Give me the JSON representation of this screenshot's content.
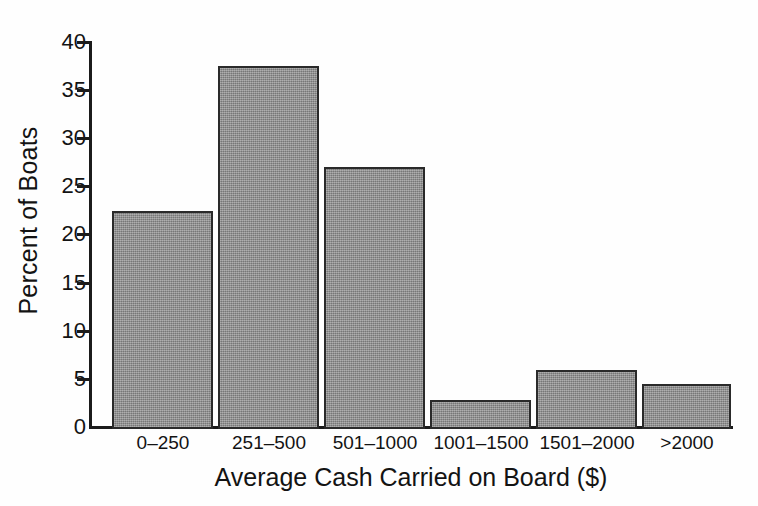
{
  "chart_data": {
    "type": "bar",
    "title": "",
    "subtitle": "",
    "xlabel": "Average Cash Carried on Board ($)",
    "ylabel": "Percent of Boats",
    "categories": [
      "0–250",
      "251–500",
      "501–1000",
      "1001–1500",
      "1501–2000",
      ">2000"
    ],
    "values": [
      22.5,
      37.4,
      27.0,
      3.0,
      6.1,
      4.6
    ],
    "ylim": [
      0,
      40
    ],
    "ytick_values": [
      0,
      5,
      10,
      15,
      20,
      25,
      30,
      35,
      40
    ],
    "ytick_labels": [
      "0",
      "5",
      "10",
      "15",
      "20",
      "25",
      "30",
      "35",
      "40"
    ],
    "xtick_labels": [
      "0–250",
      "251–500",
      "501–1000",
      "1001–1500",
      "1501–2000",
      ">2000"
    ],
    "grid": false,
    "legend": null,
    "legend_position": "none",
    "annotations": [],
    "colors": {
      "bar_fill": "#909090",
      "bar_edge": "#2a2a2a",
      "axis": "#1b1b1b",
      "text": "#131313",
      "background": "#fefefe"
    }
  }
}
